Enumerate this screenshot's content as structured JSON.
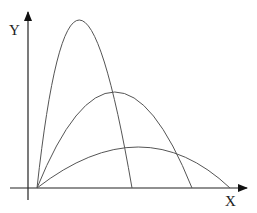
{
  "diagram": {
    "x_axis_label": "X",
    "y_axis_label": "Y",
    "curves": [
      {
        "name": "steep-trajectory",
        "start": [
          37,
          188
        ],
        "peak": [
          74,
          20
        ],
        "end": [
          132,
          188
        ]
      },
      {
        "name": "medium-trajectory",
        "start": [
          37,
          188
        ],
        "peak": [
          115,
          92
        ],
        "end": [
          192,
          188
        ]
      },
      {
        "name": "shallow-trajectory",
        "start": [
          37,
          188
        ],
        "peak": [
          143,
          147
        ],
        "end": [
          230,
          188
        ]
      }
    ],
    "colors": {
      "axis": "#222222",
      "curve": "#555555"
    }
  }
}
